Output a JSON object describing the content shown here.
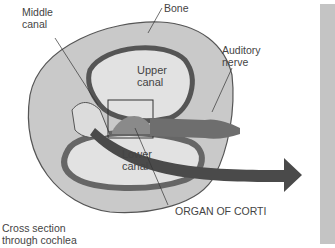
{
  "labels": {
    "middle_canal": "Middle\ncanal",
    "bone": "Bone",
    "auditory_nerve": "Auditory\nnerve",
    "upper_canal": "Upper\ncanal",
    "lower_canal": "Lower\ncanal",
    "organ_of_corti": "ORGAN OF CORTI",
    "caption": "Cross section\nthrough cochlea"
  },
  "colors": {
    "bone": "#c8c8c8",
    "canal": "#e3e3e3",
    "wall": "#6a6a6a",
    "arrow": "#4a4a4a",
    "panel": "#c4c4c4"
  }
}
